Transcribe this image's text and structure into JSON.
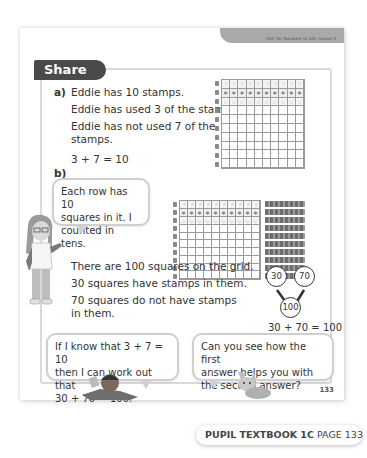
{
  "header": {
    "unit_label": "Unit 16: Numbers to 100, Lesson 4"
  },
  "section": {
    "title": "Share"
  },
  "part_a": {
    "label": "a)",
    "lines": [
      "Eddie has 10 stamps.",
      "Eddie has used 3 of the stamps.",
      "Eddie has not used 7 of the",
      "stamps."
    ],
    "equation": "3 + 7 = 10",
    "grid": {
      "rows": 10,
      "cols": 10,
      "stamp_rows": 3
    }
  },
  "part_b": {
    "label": "b)",
    "speech_girl": [
      "Each row has 10",
      "squares in it. I",
      "counted in tens."
    ],
    "lines": [
      "There are 100 squares on the grid.",
      "30 squares have stamps in them.",
      "70 squares do not have stamps",
      "in them."
    ],
    "grid": {
      "rows": 10,
      "cols": 10,
      "stamp_rows": 3
    },
    "part_whole": {
      "part1": "30",
      "part2": "70",
      "whole": "100",
      "equation": "30 + 70 = 100"
    }
  },
  "bottom_speech": {
    "boy": [
      "If I know that 3 + 7 = 10",
      "then I can work out that",
      "30 + 70 = 100."
    ],
    "cat": [
      "Can you see how the first",
      "answer helps you with",
      "the second answer?"
    ]
  },
  "page_number": "133",
  "footer": {
    "book": "PUPIL TEXTBOOK 1C",
    "page": "PAGE 133"
  }
}
